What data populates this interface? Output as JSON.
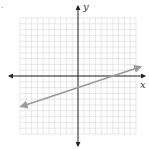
{
  "problem_marker": ".",
  "axes": {
    "x_label": "x",
    "y_label": "y",
    "x_range": [
      -10,
      10
    ],
    "y_range": [
      -10,
      10
    ],
    "grid_step": 1,
    "axis_color": "#222222",
    "grid_color": "#d8d8d8"
  },
  "line": {
    "equation": "y = (1/3)x - 2",
    "slope": 0.3333,
    "y_intercept": -2,
    "x_intercept": 6,
    "color": "#9a9a9a",
    "arrows_both_ends": true
  }
}
